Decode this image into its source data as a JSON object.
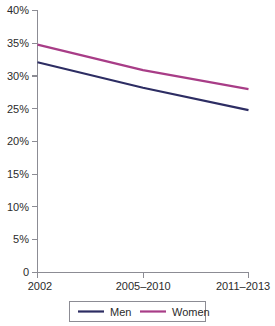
{
  "chart_data": {
    "type": "line",
    "title": "",
    "subtitle": "",
    "xlabel": "",
    "ylabel": "",
    "categories": [
      "2002",
      "2005–2010",
      "2011–2013"
    ],
    "series": [
      {
        "name": "Men",
        "color": "#2d2d63",
        "values": [
          32.1,
          28.2,
          24.8
        ]
      },
      {
        "name": "Women",
        "color": "#a83d87",
        "values": [
          34.8,
          30.9,
          28.0
        ]
      }
    ],
    "ylim": [
      0,
      40
    ],
    "ytick_values": [
      0,
      5,
      10,
      15,
      20,
      25,
      30,
      35,
      40
    ],
    "ytick_labels": [
      "0",
      "5%",
      "10%",
      "15%",
      "20%",
      "25%",
      "30%",
      "35%",
      "40%"
    ],
    "xtick_labels": [
      "2002",
      "2005–2010",
      "2011–2013"
    ],
    "grid": false,
    "legend_position": "bottom",
    "legend_entries": [
      "Men",
      "Women"
    ],
    "axis_color": "#8c8c94",
    "text_color": "#2b2b2b",
    "background": "#ffffff"
  }
}
